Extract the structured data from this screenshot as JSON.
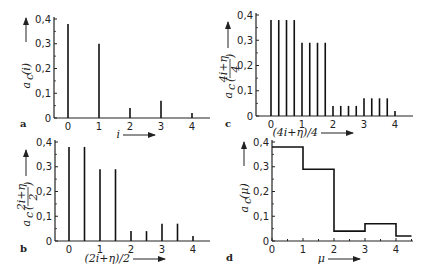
{
  "chart_data": [
    {
      "panel": "a",
      "type": "bar",
      "style": "stem",
      "xlabel": "i",
      "ylabel": "a_c(i)",
      "ylim": [
        0,
        0.4
      ],
      "xlim": [
        0,
        4.5
      ],
      "yticks": [
        "0",
        "0,1",
        "0,2",
        "0,3",
        "0,4"
      ],
      "xticks": [
        "0",
        "1",
        "2",
        "3",
        "4"
      ],
      "x": [
        0,
        1,
        2,
        3,
        4
      ],
      "values": [
        0.38,
        0.3,
        0.04,
        0.07,
        0.02
      ]
    },
    {
      "panel": "b",
      "type": "bar",
      "style": "stem",
      "xlabel": "(2i+η)/2",
      "ylabel": "a_c((2i+η)/2)",
      "ylim": [
        0,
        0.4
      ],
      "xlim": [
        0,
        4.5
      ],
      "yticks": [
        "0",
        "0,1",
        "0,2",
        "0,3",
        "0,4"
      ],
      "xticks": [
        "0",
        "1",
        "2",
        "3",
        "4"
      ],
      "x": [
        0,
        0.5,
        1,
        1.5,
        2,
        2.5,
        3,
        3.5,
        4
      ],
      "values": [
        0.38,
        0.38,
        0.29,
        0.29,
        0.04,
        0.04,
        0.07,
        0.07,
        0.02
      ]
    },
    {
      "panel": "c",
      "type": "bar",
      "style": "stem",
      "xlabel": "(4i+η)/4",
      "ylabel": "a_c((4i+η)/4)",
      "ylim": [
        0,
        0.4
      ],
      "xlim": [
        0,
        4.5
      ],
      "yticks": [
        "0",
        "0,1",
        "0,2",
        "0,3",
        "0,4"
      ],
      "xticks": [
        "0",
        "1",
        "2",
        "3",
        "4"
      ],
      "x": [
        0,
        0.25,
        0.5,
        0.75,
        1,
        1.25,
        1.5,
        1.75,
        2,
        2.25,
        2.5,
        2.75,
        3,
        3.25,
        3.5,
        3.75,
        4
      ],
      "values": [
        0.38,
        0.38,
        0.38,
        0.38,
        0.29,
        0.29,
        0.29,
        0.29,
        0.04,
        0.04,
        0.04,
        0.04,
        0.07,
        0.07,
        0.07,
        0.07,
        0.02
      ]
    },
    {
      "panel": "d",
      "type": "line",
      "style": "step",
      "xlabel": "μ",
      "ylabel": "a_c(μ)",
      "ylim": [
        0,
        0.4
      ],
      "xlim": [
        0,
        4.5
      ],
      "yticks": [
        "0",
        "0,1",
        "0,2",
        "0,3",
        "0,4"
      ],
      "xticks": [
        "0",
        "1",
        "2",
        "3",
        "4"
      ],
      "x": [
        0,
        1,
        2,
        3,
        4,
        4.5
      ],
      "values": [
        0.38,
        0.29,
        0.04,
        0.07,
        0.02,
        0.02
      ]
    }
  ],
  "labels": {
    "a": {
      "panel": "a",
      "xlabel": "i",
      "ylabel": "a",
      "ysub": "c",
      "yarg": "(i)"
    },
    "b": {
      "panel": "b",
      "xlabel": "(2i+η)/2",
      "ylabel": "a",
      "ysub": "c",
      "ynum": "2i+η",
      "yden": "2"
    },
    "c": {
      "panel": "c",
      "xlabel": "(4i+η)/4",
      "ylabel": "a",
      "ysub": "c",
      "ynum": "4i+η",
      "yden": "4"
    },
    "d": {
      "panel": "d",
      "xlabel": "μ",
      "ylabel": "a",
      "ysub": "c",
      "yarg": "(μ)"
    }
  },
  "ticks": {
    "y": [
      "0",
      "0,1",
      "0,2",
      "0,3",
      "0,4"
    ],
    "x": [
      "0",
      "1",
      "2",
      "3",
      "4"
    ]
  }
}
